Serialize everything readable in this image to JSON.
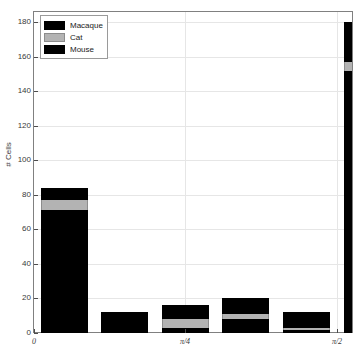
{
  "chart_data": {
    "type": "bar",
    "bar_mode": "stacked",
    "title": "",
    "xlabel": "",
    "ylabel": "# Cells",
    "x": [
      0,
      0.3142,
      0.6283,
      0.9425,
      1.2566,
      1.5708
    ],
    "categories": [
      "0",
      "",
      "",
      "",
      "",
      "π/2"
    ],
    "xlim": [
      0,
      1.6493
    ],
    "ylim": [
      0,
      186
    ],
    "xtick_values": [
      0,
      0.7854,
      1.5708
    ],
    "xtick_labels": [
      "0",
      "π/4",
      "π/2"
    ],
    "ytick_values": [
      0,
      20,
      40,
      60,
      80,
      100,
      120,
      140,
      160,
      180
    ],
    "ytick_labels": [
      "0",
      "20",
      "40",
      "60",
      "80",
      "100",
      "120",
      "140",
      "160",
      "180"
    ],
    "grid": true,
    "legend_position": "upper left",
    "series": [
      {
        "name": "Mouse",
        "color": "#000000",
        "values": [
          71,
          11,
          3,
          8,
          2,
          152
        ]
      },
      {
        "name": "Cat",
        "color": "#b3b3b3",
        "values": [
          6,
          0,
          5,
          3,
          1,
          5
        ]
      },
      {
        "name": "Macaque",
        "color": "#000000",
        "values": [
          7,
          1,
          8,
          9,
          9,
          23
        ]
      }
    ],
    "stack_order_bottom_to_top": [
      "Mouse",
      "Cat",
      "Macaque"
    ],
    "totals": [
      84,
      12,
      16,
      20,
      12,
      180
    ]
  },
  "legend": {
    "entries": [
      {
        "label": "Macaque",
        "color": "#000000"
      },
      {
        "label": "Cat",
        "color": "#b3b3b3"
      },
      {
        "label": "Mouse",
        "color": "#000000"
      }
    ]
  },
  "axes": {
    "ylabel": "# Cells"
  }
}
